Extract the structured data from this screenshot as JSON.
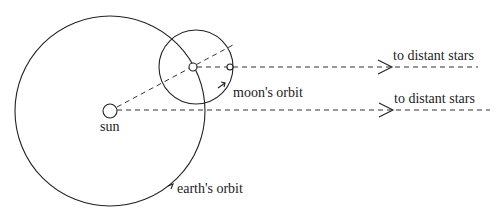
{
  "labels": {
    "sun": "sun",
    "moons_orbit": "moon's orbit",
    "earths_orbit": "earth's orbit",
    "to_stars_upper": "to distant stars",
    "to_stars_lower": "to distant stars"
  },
  "colors": {
    "stroke": "#222222",
    "background": "#ffffff"
  }
}
